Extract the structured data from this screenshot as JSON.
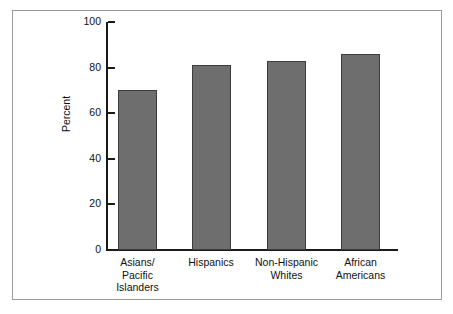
{
  "chart_data": {
    "type": "bar",
    "title": "",
    "xlabel": "",
    "ylabel": "Percent",
    "ylim": [
      0,
      100
    ],
    "yticks": [
      0,
      20,
      40,
      60,
      80,
      100
    ],
    "grid": false,
    "legend": false,
    "categories": [
      "Asians/\nPacific\nIslanders",
      "Hispanics",
      "Non-Hispanic\nWhites",
      "African\nAmericans"
    ],
    "values": [
      70,
      81,
      83,
      86
    ],
    "bar_color": "#6e6e6e",
    "bar_edge_color": "#3c3c3c",
    "axis_color": "#1a1a1a",
    "frame_color": "#9a9a9a",
    "background_color": "#ffffff"
  }
}
